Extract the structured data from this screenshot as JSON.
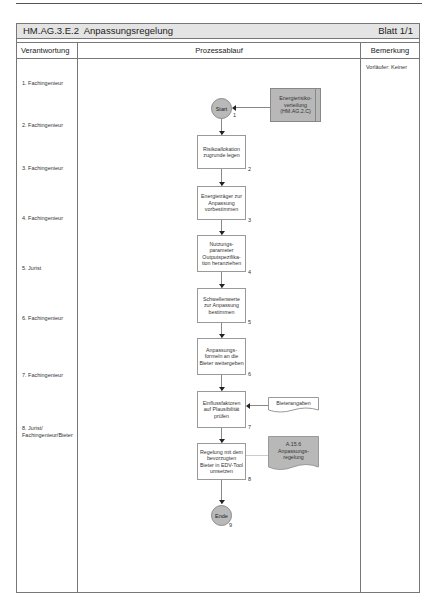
{
  "header": {
    "title": "HM.AG.3.E.2  Anpassungsregelung",
    "sheet": "Blatt 1/1"
  },
  "columns": {
    "responsibility": "Verantwortung",
    "process": "Prozessablauf",
    "remark": "Bemerkung"
  },
  "remark": "Vorläufer: Keiner",
  "roles": [
    "1. Fachingenieur",
    "2. Fachingenieur",
    "3. Fachingenieur",
    "4. Fachingenieur",
    "5. Jurist",
    "6. Fachingenieur",
    "7. Fachingenieur",
    "8. Jurist/",
    "Fachingenieur/Bieter"
  ],
  "flow": {
    "start": {
      "label": "Start",
      "num": "1"
    },
    "input_start": "Energierisiko-\nverteilung\n(HM.AG.2.C)",
    "steps": [
      {
        "label": "Risikoallokation\nzugrunde legen",
        "num": "2"
      },
      {
        "label": "Energieträger zur\nAnpassung\nvorbestimmen",
        "num": "3"
      },
      {
        "label": "Nutzungs-\nparameter\nOutputspezifika-\ntion heranziehen",
        "num": "4"
      },
      {
        "label": "Schwellenwerte\nzur Anpassung\nbestimmen",
        "num": "5"
      },
      {
        "label": "Anpassungs-\nformeln an die\nBieter weitergeben",
        "num": "6"
      },
      {
        "label": "Einflussfaktoren\nauf Plausibilität\nprüfen",
        "num": "7"
      },
      {
        "label": "Regelung mit dem\nbevorzugten\nBieter in EDV-Tool\numsetzen",
        "num": "8"
      }
    ],
    "input_step7": "Bieterangaben",
    "output_step8": "A.15.6\nAnpassungs-\nregelung",
    "end": {
      "label": "Ende",
      "num": "9"
    }
  },
  "colors": {
    "shape_gray": "#b8b8b8",
    "title_bg": "#e4e4e4",
    "border": "#777777"
  }
}
